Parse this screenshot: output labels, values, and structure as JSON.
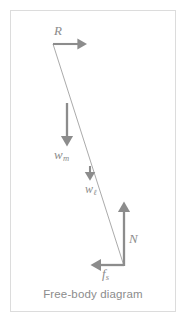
{
  "figure": {
    "caption": "Free-body diagram",
    "frame_color": "#dcdcdc",
    "background_color": "#ffffff",
    "stroke_color": "#8c8c8c",
    "body_line_color": "#9a9a9a",
    "label_color": "#8c8c8c"
  },
  "vectors": [
    {
      "name": "R",
      "symbol": "R",
      "subscript": "",
      "direction": "right",
      "tail": [
        53,
        44
      ],
      "head": [
        86,
        44
      ],
      "label_pos": [
        54,
        24
      ]
    },
    {
      "name": "w_m",
      "symbol": "w",
      "subscript": "m",
      "direction": "down",
      "tail": [
        67,
        103
      ],
      "head": [
        67,
        145
      ],
      "label_pos": [
        54,
        148
      ]
    },
    {
      "name": "w_l",
      "symbol": "w",
      "subscript": "ℓ",
      "direction": "down",
      "tail": [
        90,
        166
      ],
      "head": [
        90,
        181
      ],
      "label_pos": [
        85,
        183
      ]
    },
    {
      "name": "N",
      "symbol": "N",
      "subscript": "",
      "direction": "up",
      "tail": [
        124,
        266
      ],
      "head": [
        124,
        202
      ],
      "label_pos": [
        129,
        232
      ]
    },
    {
      "name": "f_s",
      "symbol": "f",
      "subscript": "s",
      "direction": "left",
      "tail": [
        124,
        265
      ],
      "head": [
        91,
        265
      ],
      "label_pos": [
        102,
        267
      ]
    }
  ],
  "body_line": {
    "name": "rigid-body-line",
    "start": [
      53,
      44
    ],
    "end": [
      124,
      266
    ]
  },
  "icons": {
    "arrowhead": "arrowhead-icon"
  }
}
